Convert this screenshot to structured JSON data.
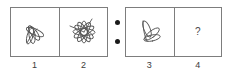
{
  "puzzle": {
    "type": "visual-analogy",
    "separator": {
      "name": "colon-separator",
      "dots": 2
    },
    "pairs": [
      {
        "id": "left-pair",
        "cells": [
          {
            "number": "1",
            "content_type": "figure",
            "figure": "leaf-cluster-four-petals",
            "description": "cluster of four elongated petal loops fanning out from a common base"
          },
          {
            "number": "2",
            "content_type": "figure",
            "figure": "flower-six-petals",
            "description": "six elongated petal loops radiating symmetrically from a center point"
          }
        ]
      },
      {
        "id": "right-pair",
        "cells": [
          {
            "number": "3",
            "content_type": "figure",
            "figure": "leaf-cluster-three-petals",
            "description": "cluster of three elongated petal loops fanning out from a common base"
          },
          {
            "number": "4",
            "content_type": "question",
            "figure": "question-mark",
            "value": "?",
            "description": "unknown answer cell marked with a question mark"
          }
        ]
      }
    ],
    "colors": {
      "stroke": "#555555",
      "border": "#7d7d7d",
      "background": "#ffffff",
      "text": "#3c3c3c",
      "dot": "#1a1a1a"
    }
  }
}
